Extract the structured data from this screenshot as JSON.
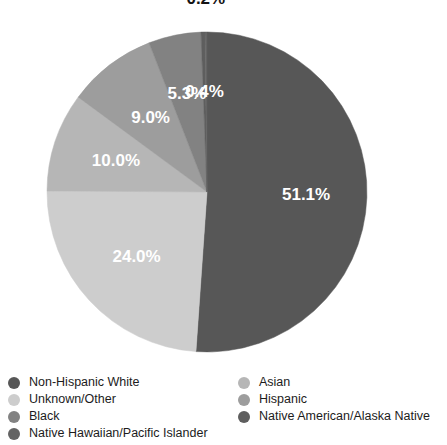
{
  "chart_data": {
    "type": "pie",
    "title": "",
    "subtitle": "",
    "xlabel": "",
    "ylabel": "",
    "legend_position": "bottom",
    "grid": false,
    "labels_format": "percent",
    "categories": [
      "Non-Hispanic White",
      "Unknown/Other",
      "Black",
      "Native Hawaiian/Pacific Islander",
      "Asian",
      "Hispanic",
      "Native American/Alaska Native"
    ],
    "slices": [
      {
        "label": "Non-Hispanic White",
        "value": 51.1,
        "display": "51.1%",
        "color": "#575757",
        "label_inside": true,
        "label_r": 0.62
      },
      {
        "label": "Unknown/Other",
        "value": 24.0,
        "display": "24.0%",
        "color": "#cdcdcd",
        "label_inside": true,
        "label_r": 0.6
      },
      {
        "label": "Asian",
        "value": 10.0,
        "display": "10.0%",
        "color": "#b6b6b6",
        "label_inside": true,
        "label_r": 0.6
      },
      {
        "label": "Hispanic",
        "value": 9.0,
        "display": "9.0%",
        "color": "#9d9d9d",
        "label_inside": true,
        "label_r": 0.58
      },
      {
        "label": "Black",
        "value": 5.3,
        "display": "5.3%",
        "color": "#828282",
        "label_inside": true,
        "label_r": 0.62
      },
      {
        "label": "Native American/Alaska Native",
        "value": 0.4,
        "display": "0.4%",
        "color": "#5e5e5e",
        "label_inside": true,
        "label_r": 0.62
      },
      {
        "label": "Native Hawaiian/Pacific Islander",
        "value": 0.2,
        "display": "0.2%",
        "color": "#646464",
        "label_inside": false,
        "label_r": 1.2
      }
    ],
    "values": [
      51.1,
      24.0,
      10.0,
      9.0,
      5.3,
      0.4,
      0.2
    ],
    "geometry": {
      "cx": 207,
      "cy": 192,
      "r": 160,
      "start_angle_deg": 0,
      "direction": "clockwise"
    }
  },
  "legend": {
    "columns": [
      {
        "items": [
          {
            "label": "Non-Hispanic White",
            "color": "#575757"
          },
          {
            "label": "Unknown/Other",
            "color": "#cdcdcd"
          },
          {
            "label": "Black",
            "color": "#828282"
          },
          {
            "label": "Native Hawaiian/Pacific Islander",
            "color": "#646464"
          }
        ]
      },
      {
        "items": [
          {
            "label": "Asian",
            "color": "#b6b6b6"
          },
          {
            "label": "Hispanic",
            "color": "#9d9d9d"
          },
          {
            "label": "Native American/Alaska Native",
            "color": "#5e5e5e"
          }
        ]
      }
    ]
  }
}
